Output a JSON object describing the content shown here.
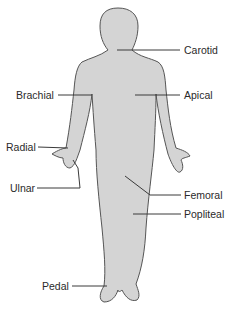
{
  "diagram": {
    "colors": {
      "body_fill": "#d4d4d4",
      "outline": "#555555",
      "leader": "#3a3a3a",
      "text": "#2a2a2a"
    },
    "labels": [
      {
        "id": "carotid",
        "text": "Carotid"
      },
      {
        "id": "brachial",
        "text": "Brachial"
      },
      {
        "id": "apical",
        "text": "Apical"
      },
      {
        "id": "radial",
        "text": "Radial"
      },
      {
        "id": "ulnar",
        "text": "Ulnar"
      },
      {
        "id": "femoral",
        "text": "Femoral"
      },
      {
        "id": "popliteal",
        "text": "Popliteal"
      },
      {
        "id": "pedal",
        "text": "Pedal"
      }
    ]
  }
}
